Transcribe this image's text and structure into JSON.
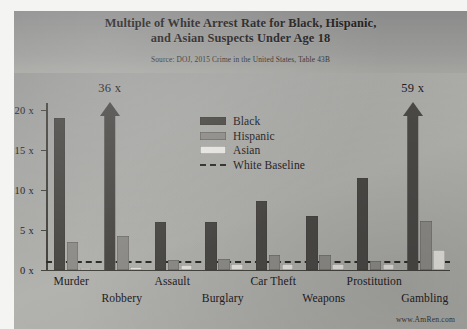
{
  "chart_data": {
    "type": "bar",
    "title": [
      "Multiple of White Arrest Rate for Black, Hispanic,",
      "and Asian Suspects Under Age 18"
    ],
    "subtitle": "Source: DOJ, 2015 Crime in the United States, Table 43B",
    "xlabel": "",
    "ylabel": "",
    "ylim": [
      0,
      21
    ],
    "yticks": [
      "0 x",
      "5 x",
      "10 x",
      "15 x",
      "20 x"
    ],
    "ytick_values": [
      0,
      5,
      10,
      15,
      20
    ],
    "grid": false,
    "legend_position": "inside-upper-center",
    "categories": [
      "Murder",
      "Robbery",
      "Assault",
      "Burglary",
      "Car Theft",
      "Weapons",
      "Prostitution",
      "Gambling"
    ],
    "series": [
      {
        "name": "Black",
        "color": "#4c4a47",
        "values": [
          19,
          36,
          6,
          6,
          8.6,
          6.8,
          11.5,
          59
        ],
        "overflow": [
          false,
          true,
          false,
          false,
          false,
          false,
          false,
          true
        ],
        "labels": [
          "",
          "36 x",
          "",
          "",
          "",
          "",
          "",
          "59 x"
        ]
      },
      {
        "name": "Hispanic",
        "color": "#8f8d89",
        "values": [
          3.5,
          4.3,
          1.3,
          1.4,
          1.9,
          1.9,
          1.1,
          6.1
        ]
      },
      {
        "name": "Asian",
        "color": "#e9e8e3",
        "values": [
          0.3,
          0.4,
          0.6,
          0.8,
          0.7,
          0.8,
          0.7,
          2.5
        ]
      }
    ],
    "baseline": {
      "label": "White Baseline",
      "value": 1,
      "style": "dashed",
      "color": "#2f2d29"
    },
    "annotations": [
      "36 x",
      "59 x"
    ],
    "watermark": "www.AmRen.com"
  },
  "legend": {
    "items": [
      {
        "label": "Black",
        "swatch": "black"
      },
      {
        "label": "Hispanic",
        "swatch": "hisp"
      },
      {
        "label": "Asian",
        "swatch": "asian"
      },
      {
        "label": "White Baseline",
        "swatch": "dash"
      }
    ]
  }
}
